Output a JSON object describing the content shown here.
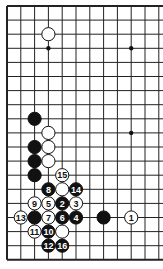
{
  "board": {
    "type": "go-diagram-corner",
    "visible_columns": 12,
    "visible_rows": 19,
    "edges": [
      "left",
      "top",
      "bottom"
    ],
    "origin_x": 7,
    "origin_y": 6,
    "spacing_x": 13.8,
    "spacing_y": 14.1,
    "line_color": "#222222",
    "background": "#ffffff"
  },
  "star_points": [
    {
      "col": 3,
      "row": 3
    },
    {
      "col": 9,
      "row": 3
    },
    {
      "col": 9,
      "row": 9
    }
  ],
  "stones": [
    {
      "col": 3,
      "row": 2,
      "color": "white",
      "label": ""
    },
    {
      "col": 2,
      "row": 8,
      "color": "black",
      "label": ""
    },
    {
      "col": 3,
      "row": 9,
      "color": "white",
      "label": ""
    },
    {
      "col": 2,
      "row": 10,
      "color": "black",
      "label": ""
    },
    {
      "col": 3,
      "row": 10,
      "color": "white",
      "label": ""
    },
    {
      "col": 2,
      "row": 11,
      "color": "black",
      "label": ""
    },
    {
      "col": 3,
      "row": 11,
      "color": "white",
      "label": ""
    },
    {
      "col": 2,
      "row": 12,
      "color": "black",
      "label": ""
    },
    {
      "col": 4,
      "row": 12,
      "color": "white",
      "label": "15"
    },
    {
      "col": 3,
      "row": 13,
      "color": "black",
      "label": "8"
    },
    {
      "col": 4,
      "row": 13,
      "color": "white",
      "label": ""
    },
    {
      "col": 5,
      "row": 13,
      "color": "black",
      "label": "14"
    },
    {
      "col": 2,
      "row": 14,
      "color": "white",
      "label": "9"
    },
    {
      "col": 3,
      "row": 14,
      "color": "white",
      "label": "5"
    },
    {
      "col": 4,
      "row": 14,
      "color": "black",
      "label": "2"
    },
    {
      "col": 5,
      "row": 14,
      "color": "white",
      "label": "3"
    },
    {
      "col": 1,
      "row": 15,
      "color": "white",
      "label": "13"
    },
    {
      "col": 2,
      "row": 15,
      "color": "black",
      "label": ""
    },
    {
      "col": 3,
      "row": 15,
      "color": "white",
      "label": "7"
    },
    {
      "col": 4,
      "row": 15,
      "color": "black",
      "label": "6"
    },
    {
      "col": 5,
      "row": 15,
      "color": "black",
      "label": "4"
    },
    {
      "col": 7,
      "row": 15,
      "color": "black",
      "label": ""
    },
    {
      "col": 9,
      "row": 15,
      "color": "white",
      "label": "1"
    },
    {
      "col": 2,
      "row": 16,
      "color": "white",
      "label": "11"
    },
    {
      "col": 3,
      "row": 16,
      "color": "black",
      "label": "10"
    },
    {
      "col": 4,
      "row": 16,
      "color": "white",
      "label": ""
    },
    {
      "col": 3,
      "row": 17,
      "color": "black",
      "label": "12"
    },
    {
      "col": 4,
      "row": 17,
      "color": "black",
      "label": "16"
    }
  ]
}
